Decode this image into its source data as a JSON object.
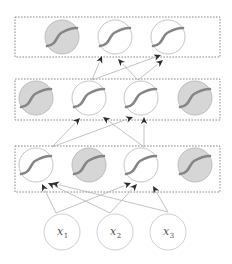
{
  "diagram": {
    "title": "",
    "colors": {
      "active_fill": "#ffffff",
      "dropped_fill": "#d6d6d6",
      "sigmoid_stroke": "#858585",
      "edge": "#b4b4b4",
      "arrowhead": "#2b2b2b",
      "box_border": "#707070"
    },
    "layers": [
      {
        "name": "output-layer",
        "box": {
          "x": 15,
          "y": 17,
          "w": 205,
          "h": 40
        },
        "units": [
          {
            "cx": 62,
            "cy": 37,
            "dropped": true
          },
          {
            "cx": 115,
            "cy": 37,
            "dropped": false
          },
          {
            "cx": 168,
            "cy": 37,
            "dropped": false
          }
        ]
      },
      {
        "name": "hidden-layer-2",
        "box": {
          "x": 15,
          "y": 79,
          "w": 205,
          "h": 41
        },
        "units": [
          {
            "cx": 36,
            "cy": 98,
            "dropped": true
          },
          {
            "cx": 89,
            "cy": 98,
            "dropped": false
          },
          {
            "cx": 141,
            "cy": 98,
            "dropped": false
          },
          {
            "cx": 195,
            "cy": 98,
            "dropped": true
          }
        ]
      },
      {
        "name": "hidden-layer-1",
        "box": {
          "x": 15,
          "y": 146,
          "w": 205,
          "h": 46
        },
        "units": [
          {
            "cx": 36,
            "cy": 165,
            "dropped": false
          },
          {
            "cx": 89,
            "cy": 165,
            "dropped": true
          },
          {
            "cx": 141,
            "cy": 165,
            "dropped": false
          },
          {
            "cx": 195,
            "cy": 165,
            "dropped": true
          }
        ]
      }
    ],
    "inputs": [
      {
        "label": "x",
        "sub": "1",
        "cx": 62,
        "cy": 232
      },
      {
        "label": "x",
        "sub": "2",
        "cx": 115,
        "cy": 232
      },
      {
        "label": "x",
        "sub": "3",
        "cx": 168,
        "cy": 232
      }
    ],
    "edges": [
      {
        "from": [
          56,
          213
        ],
        "to": [
          42,
          184
        ]
      },
      {
        "from": [
          56,
          213
        ],
        "to": [
          131,
          183
        ]
      },
      {
        "from": [
          110,
          213
        ],
        "to": [
          48,
          183
        ]
      },
      {
        "from": [
          110,
          213
        ],
        "to": [
          137,
          184
        ]
      },
      {
        "from": [
          168,
          212
        ],
        "to": [
          52,
          183
        ]
      },
      {
        "from": [
          168,
          212
        ],
        "to": [
          153,
          186
        ]
      },
      {
        "from": [
          52,
          147
        ],
        "to": [
          80,
          118
        ]
      },
      {
        "from": [
          52,
          147
        ],
        "to": [
          133,
          117
        ]
      },
      {
        "from": [
          144,
          147
        ],
        "to": [
          103,
          117
        ]
      },
      {
        "from": [
          144,
          147
        ],
        "to": [
          144,
          117
        ]
      },
      {
        "from": [
          92,
          80
        ],
        "to": [
          102,
          56
        ]
      },
      {
        "from": [
          92,
          80
        ],
        "to": [
          161,
          55
        ]
      },
      {
        "from": [
          138,
          80
        ],
        "to": [
          118,
          59
        ]
      },
      {
        "from": [
          138,
          80
        ],
        "to": [
          163,
          60
        ]
      }
    ]
  }
}
